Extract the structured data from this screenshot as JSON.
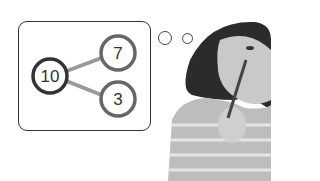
{
  "number_bond": {
    "whole": "10",
    "parts": [
      "7",
      "3"
    ]
  },
  "colors": {
    "whole_ring": "#333333",
    "part_ring": "#666666",
    "connector": "#999999",
    "bubble_border": "#333333"
  },
  "illustration": {
    "subject": "girl-thinking-with-pencil"
  }
}
